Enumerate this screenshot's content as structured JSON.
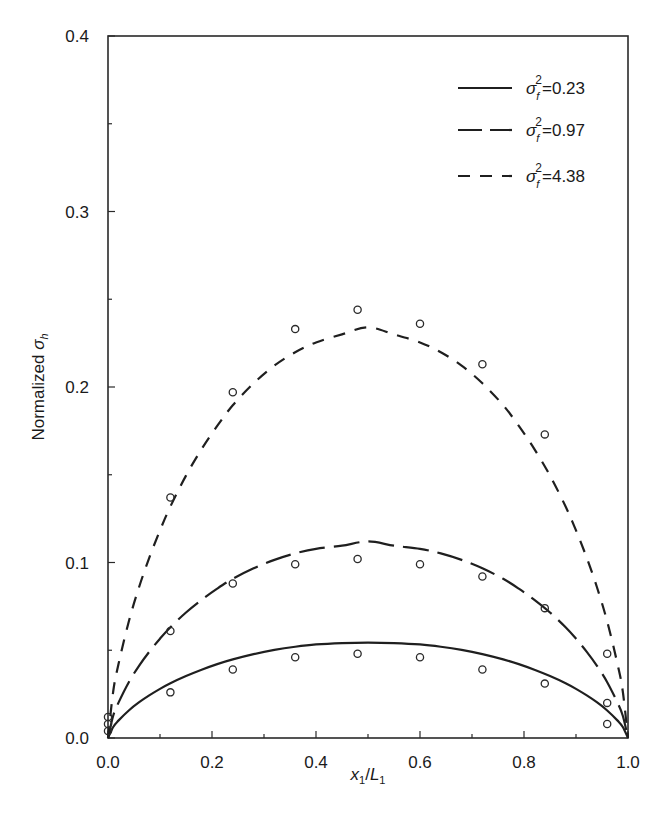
{
  "chart_data": {
    "type": "line",
    "title": "",
    "xlabel": {
      "main": "x",
      "sub1": "1",
      "slash": "/",
      "main2": "L",
      "sub2": "1"
    },
    "ylabel": {
      "prefix": "Normalized ",
      "symbol": "σ",
      "sub": "h"
    },
    "xlim": [
      0.0,
      1.0
    ],
    "ylim": [
      0.0,
      0.4
    ],
    "x_ticks": [
      0.0,
      0.2,
      0.4,
      0.6,
      0.8,
      1.0
    ],
    "x_tick_labels": [
      "0.0",
      "0.2",
      "0.4",
      "0.6",
      "0.8",
      "1.0"
    ],
    "x_minor_ticks": [
      0.1,
      0.3,
      0.5,
      0.7,
      0.9
    ],
    "y_ticks": [
      0.0,
      0.1,
      0.2,
      0.3,
      0.4
    ],
    "y_tick_labels": [
      "0.0",
      "0.1",
      "0.2",
      "0.3",
      "0.4"
    ],
    "y_minor_ticks": [
      0.05,
      0.15,
      0.25,
      0.35
    ],
    "grid": false,
    "legend_position": "top-right",
    "series": [
      {
        "name": "σf² = 0.23",
        "legend": {
          "symbol": "σ",
          "sub": "f",
          "sup": "2",
          "eq": "=0.23"
        },
        "line_style": "solid",
        "curve_x": [
          0.0,
          0.01,
          0.02,
          0.04,
          0.06,
          0.08,
          0.1,
          0.12,
          0.15,
          0.18,
          0.21,
          0.24,
          0.28,
          0.32,
          0.36,
          0.4,
          0.45,
          0.5,
          0.55,
          0.6,
          0.64,
          0.68,
          0.72,
          0.76,
          0.79,
          0.82,
          0.85,
          0.88,
          0.9,
          0.92,
          0.94,
          0.96,
          0.98,
          0.99,
          1.0
        ],
        "curve_y": [
          0.0,
          0.0063,
          0.0099,
          0.0157,
          0.0204,
          0.0244,
          0.028,
          0.0312,
          0.0353,
          0.0389,
          0.0421,
          0.0448,
          0.0478,
          0.0502,
          0.052,
          0.0533,
          0.0541,
          0.0544,
          0.0541,
          0.0533,
          0.052,
          0.0502,
          0.0478,
          0.0448,
          0.0421,
          0.0389,
          0.0353,
          0.0312,
          0.028,
          0.0244,
          0.0204,
          0.0157,
          0.0099,
          0.0063,
          0.0
        ],
        "points_x": [
          0.0,
          0.0,
          0.0,
          0.12,
          0.24,
          0.36,
          0.48,
          0.6,
          0.72,
          0.84,
          0.96
        ],
        "points_y": [
          0.004,
          0.008,
          0.012,
          0.026,
          0.039,
          0.046,
          0.048,
          0.046,
          0.039,
          0.031,
          0.008
        ]
      },
      {
        "name": "σf² = 0.97",
        "legend": {
          "symbol": "σ",
          "sub": "f",
          "sup": "2",
          "eq": "=0.97"
        },
        "line_style": "long-dash",
        "curve_x": [
          0.0,
          0.01,
          0.02,
          0.04,
          0.06,
          0.08,
          0.1,
          0.12,
          0.15,
          0.18,
          0.21,
          0.24,
          0.28,
          0.32,
          0.36,
          0.4,
          0.45,
          0.5,
          0.55,
          0.6,
          0.64,
          0.68,
          0.72,
          0.76,
          0.79,
          0.82,
          0.85,
          0.88,
          0.9,
          0.92,
          0.94,
          0.96,
          0.98,
          0.99,
          1.0
        ],
        "curve_y": [
          0.0,
          0.0127,
          0.02,
          0.0318,
          0.0413,
          0.0494,
          0.0566,
          0.0631,
          0.0715,
          0.0787,
          0.0851,
          0.0907,
          0.0967,
          0.1015,
          0.1052,
          0.1078,
          0.1096,
          0.112,
          0.1096,
          0.1078,
          0.1052,
          0.1015,
          0.0967,
          0.0907,
          0.0851,
          0.0787,
          0.0715,
          0.0631,
          0.0566,
          0.0494,
          0.0413,
          0.0318,
          0.02,
          0.0127,
          0.0
        ],
        "points_x": [
          0.12,
          0.24,
          0.36,
          0.48,
          0.6,
          0.72,
          0.84,
          0.96
        ],
        "points_y": [
          0.061,
          0.088,
          0.099,
          0.102,
          0.099,
          0.092,
          0.074,
          0.02
        ]
      },
      {
        "name": "σf² = 4.38",
        "legend": {
          "symbol": "σ",
          "sub": "f",
          "sup": "2",
          "eq": "=4.38"
        },
        "line_style": "short-dash",
        "curve_x": [
          0.0,
          0.01,
          0.02,
          0.04,
          0.06,
          0.08,
          0.1,
          0.12,
          0.15,
          0.18,
          0.21,
          0.24,
          0.28,
          0.32,
          0.36,
          0.4,
          0.45,
          0.5,
          0.55,
          0.6,
          0.64,
          0.68,
          0.72,
          0.76,
          0.79,
          0.82,
          0.85,
          0.88,
          0.9,
          0.92,
          0.94,
          0.96,
          0.98,
          0.99,
          1.0
        ],
        "curve_y": [
          0.0,
          0.0265,
          0.0419,
          0.0664,
          0.0862,
          0.1032,
          0.1183,
          0.1319,
          0.1495,
          0.1646,
          0.1778,
          0.1896,
          0.2021,
          0.2122,
          0.2198,
          0.2254,
          0.23,
          0.234,
          0.23,
          0.2254,
          0.2198,
          0.2122,
          0.2021,
          0.1896,
          0.1778,
          0.1646,
          0.1495,
          0.1319,
          0.1183,
          0.1032,
          0.0862,
          0.0664,
          0.0419,
          0.0265,
          0.0
        ],
        "points_x": [
          0.12,
          0.24,
          0.36,
          0.48,
          0.6,
          0.72,
          0.84,
          0.96
        ],
        "points_y": [
          0.137,
          0.197,
          0.233,
          0.244,
          0.236,
          0.213,
          0.173,
          0.048
        ]
      }
    ]
  }
}
